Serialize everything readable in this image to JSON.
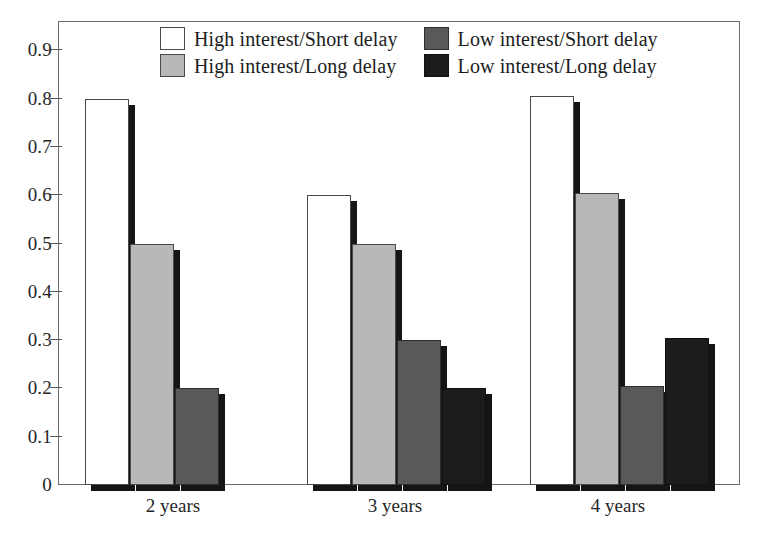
{
  "chart_data": {
    "type": "bar",
    "title": "",
    "subtitle": "",
    "xlabel": "",
    "ylabel": "",
    "categories": [
      "2 years",
      "3 years",
      "4 years"
    ],
    "series": [
      {
        "name": "High interest/Short delay",
        "color": "#ffffff",
        "swatch": "f-white",
        "values": [
          0.8,
          0.6,
          0.805
        ]
      },
      {
        "name": "High interest/Long delay",
        "color": "#b8b8b8",
        "swatch": "f-lgray",
        "values": [
          0.5,
          0.5,
          0.605
        ]
      },
      {
        "name": "Low interest/Short delay",
        "color": "#595959",
        "swatch": "f-dgray",
        "values": [
          0.2,
          0.3,
          0.205
        ]
      },
      {
        "name": "Low interest/Long delay",
        "color": "#1c1c1c",
        "swatch": "f-black",
        "values": [
          0.0,
          0.2,
          0.305
        ]
      }
    ],
    "ylim": [
      0,
      0.96
    ],
    "yticks": [
      0,
      0.1,
      0.2,
      0.3,
      0.4,
      0.5,
      0.6,
      0.7,
      0.8,
      0.9
    ],
    "ytick_labels": [
      "0",
      "0.1",
      "0.2",
      "0.3",
      "0.4",
      "0.5",
      "0.6",
      "0.7",
      "0.8",
      "0.9"
    ],
    "grid": false,
    "legend_position": "top-center",
    "bar_style": "drop-shadow-3d"
  },
  "axis": {
    "y_labels": [
      "0.9",
      "0.8",
      "0.7",
      "0.6",
      "0.5",
      "0.4",
      "0.3",
      "0.2",
      "0.1",
      "0"
    ],
    "x_labels": [
      "2 years",
      "3 years",
      "4 years"
    ]
  },
  "legend": {
    "items": [
      {
        "label": "High interest/Short delay",
        "swatch": "f-white"
      },
      {
        "label": "Low interest/Short delay",
        "swatch": "f-dgray"
      },
      {
        "label": "High interest/Long delay",
        "swatch": "f-lgray"
      },
      {
        "label": "Low interest/Long delay",
        "swatch": "f-black"
      }
    ]
  }
}
